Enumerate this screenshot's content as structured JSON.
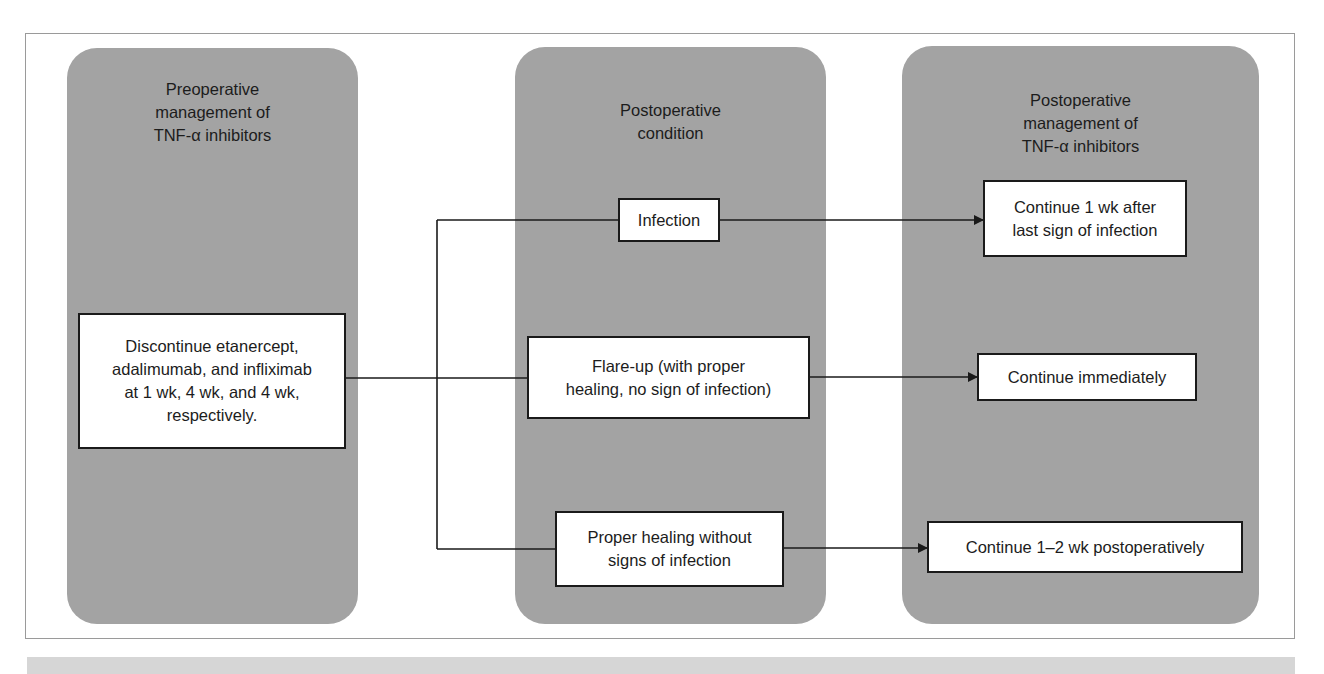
{
  "diagram": {
    "type": "flowchart",
    "columns": [
      {
        "id": "preoperative",
        "title": "Preoperative\nmanagement of\nTNF-α inhibitors",
        "nodes": [
          {
            "id": "discontinue",
            "text": "Discontinue etanercept,\nadalimumab, and infliximab\nat 1 wk, 4 wk, and 4 wk,\nrespectively."
          }
        ]
      },
      {
        "id": "postop-condition",
        "title": "Postoperative\ncondition",
        "nodes": [
          {
            "id": "infection",
            "text": "Infection"
          },
          {
            "id": "flare-up",
            "text": "Flare-up (with proper\nhealing, no sign of infection)"
          },
          {
            "id": "proper-healing",
            "text": "Proper healing without\nsigns of infection"
          }
        ]
      },
      {
        "id": "postop-management",
        "title": "Postoperative\nmanagement of\nTNF-α inhibitors",
        "nodes": [
          {
            "id": "continue-after-infection",
            "text": "Continue 1 wk after\nlast sign of infection"
          },
          {
            "id": "continue-immediately",
            "text": "Continue immediately"
          },
          {
            "id": "continue-1-2-wk",
            "text": "Continue 1–2 wk postoperatively"
          }
        ]
      }
    ],
    "edges": [
      {
        "from": "discontinue",
        "to": "infection"
      },
      {
        "from": "discontinue",
        "to": "flare-up"
      },
      {
        "from": "discontinue",
        "to": "proper-healing"
      },
      {
        "from": "infection",
        "to": "continue-after-infection",
        "arrow": true
      },
      {
        "from": "flare-up",
        "to": "continue-immediately",
        "arrow": true
      },
      {
        "from": "proper-healing",
        "to": "continue-1-2-wk",
        "arrow": true
      }
    ],
    "colors": {
      "panel": "#a3a3a3",
      "box": "#ffffff",
      "line": "#1a1a1a",
      "frame": "#9a9a9a"
    }
  }
}
